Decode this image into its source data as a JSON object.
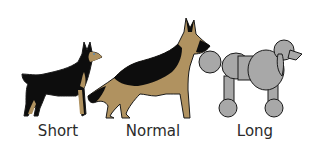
{
  "colors": {
    "black_coat": "#0d0d0d",
    "tan_coat": "#b09260",
    "poodle_fill": "#a8a8a8",
    "outline": "#1a1a1a",
    "label_text": "#2b2b2b",
    "background": "#ffffff"
  },
  "dogs": [
    {
      "breed_icon": "doberman-icon",
      "label": "Short"
    },
    {
      "breed_icon": "german-shepherd-icon",
      "label": "Normal"
    },
    {
      "breed_icon": "poodle-icon",
      "label": "Long"
    }
  ]
}
